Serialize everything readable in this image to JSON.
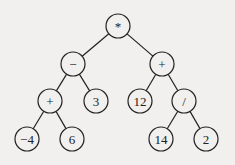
{
  "diagram": {
    "type": "expression-tree",
    "nodes": [
      {
        "id": "n0",
        "label": "*",
        "x": 118,
        "y": 26
      },
      {
        "id": "n1",
        "label": "−",
        "x": 73,
        "y": 64
      },
      {
        "id": "n2",
        "label": "+",
        "x": 162,
        "y": 64
      },
      {
        "id": "n3",
        "label": "+",
        "x": 50,
        "y": 101
      },
      {
        "id": "n4",
        "label": "3",
        "x": 96,
        "y": 101
      },
      {
        "id": "n5",
        "label": "12",
        "x": 140,
        "y": 101
      },
      {
        "id": "n6",
        "label": "/",
        "x": 184,
        "y": 101
      },
      {
        "id": "n7",
        "label": "−4",
        "x": 27,
        "y": 139
      },
      {
        "id": "n8",
        "label": "6",
        "x": 72,
        "y": 139
      },
      {
        "id": "n9",
        "label": "14",
        "x": 161,
        "y": 139
      },
      {
        "id": "n10",
        "label": "2",
        "x": 206,
        "y": 139
      }
    ],
    "edges": [
      [
        "n0",
        "n1"
      ],
      [
        "n0",
        "n2"
      ],
      [
        "n1",
        "n3"
      ],
      [
        "n1",
        "n4"
      ],
      [
        "n2",
        "n5"
      ],
      [
        "n2",
        "n6"
      ],
      [
        "n3",
        "n7"
      ],
      [
        "n3",
        "n8"
      ],
      [
        "n6",
        "n9"
      ],
      [
        "n6",
        "n10"
      ]
    ],
    "node_radius": 12,
    "stroke_color": "#222222",
    "node_fill": "#f1f0ee"
  }
}
